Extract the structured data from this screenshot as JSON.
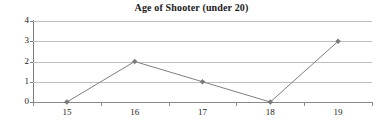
{
  "chart_data": {
    "type": "line",
    "title": "Age of Shooter (under 20)",
    "xlabel": "",
    "ylabel": "",
    "categories": [
      "15",
      "16",
      "17",
      "18",
      "19"
    ],
    "values": [
      0,
      2,
      1,
      0,
      3
    ],
    "series": [
      {
        "name": "Age of Shooter",
        "values": [
          0,
          2,
          1,
          0,
          3
        ]
      }
    ],
    "ylim": [
      0,
      4
    ],
    "y_ticks": [
      "0",
      "1",
      "2",
      "3",
      "4"
    ],
    "x_ticks": [
      "15",
      "16",
      "17",
      "18",
      "19"
    ],
    "grid": true,
    "legend": false,
    "marker": "diamond",
    "colors": {
      "line": "#808080",
      "marker": "#7a7a7a",
      "gridline": "#bfbfbf",
      "axis": "#7d7d7d",
      "text": "#1a1a1a",
      "background": "#ffffff"
    }
  }
}
